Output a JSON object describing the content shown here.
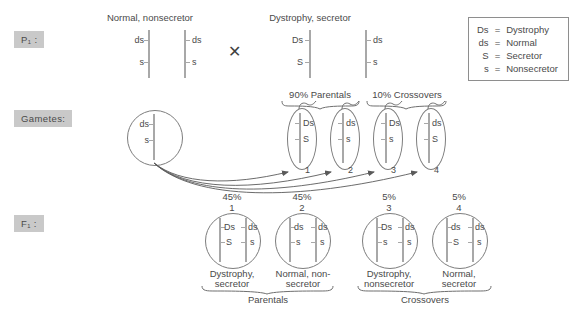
{
  "diagram": {
    "title_rows": {
      "p1": "P₁ :",
      "gametes": "Gametes:",
      "f1": "F₁ :"
    },
    "cross_symbol": "✕",
    "p1": {
      "parent_left": {
        "phenotype": "Normal, nonsecretor",
        "homolog_a": [
          "ds",
          "s"
        ],
        "homolog_b": [
          "ds",
          "s"
        ]
      },
      "parent_right": {
        "phenotype": "Dystrophy, secretor",
        "homolog_a": [
          "Ds",
          "S"
        ],
        "homolog_b": [
          "ds",
          "s"
        ]
      }
    },
    "group_headers": [
      {
        "label": "90% Parentals"
      },
      {
        "label": "10% Crossovers"
      }
    ],
    "gametes": {
      "maternal": {
        "alleles": [
          "ds",
          "s"
        ]
      },
      "paternal": [
        {
          "number": "1",
          "alleles": [
            "Ds",
            "S"
          ]
        },
        {
          "number": "2",
          "alleles": [
            "ds",
            "s"
          ]
        },
        {
          "number": "3",
          "alleles": [
            "Ds",
            "s"
          ]
        },
        {
          "number": "4",
          "alleles": [
            "ds",
            "S"
          ]
        }
      ]
    },
    "f1": {
      "offspring": [
        {
          "percent": "45%",
          "number": "1",
          "chromosome_left": [
            "Ds",
            "S"
          ],
          "chromosome_right": [
            "ds",
            "s"
          ],
          "phenotype_line1": "Dystrophy,",
          "phenotype_line2": "secretor"
        },
        {
          "percent": "45%",
          "number": "2",
          "chromosome_left": [
            "ds",
            "s"
          ],
          "chromosome_right": [
            "ds",
            "s"
          ],
          "phenotype_line1": "Normal, non-",
          "phenotype_line2": "secretor"
        },
        {
          "percent": "5%",
          "number": "3",
          "chromosome_left": [
            "Ds",
            "s"
          ],
          "chromosome_right": [
            "ds",
            "s"
          ],
          "phenotype_line1": "Dystrophy,",
          "phenotype_line2": "nonsecretor"
        },
        {
          "percent": "5%",
          "number": "4",
          "chromosome_left": [
            "ds",
            "S"
          ],
          "chromosome_right": [
            "ds",
            "s"
          ],
          "phenotype_line1": "Normal,",
          "phenotype_line2": "secretor"
        }
      ],
      "group_labels": [
        {
          "label": "Parentals"
        },
        {
          "label": "Crossovers"
        }
      ]
    },
    "legend": {
      "rows": [
        {
          "symbol": "Ds",
          "equals": "=",
          "meaning": "Dystrophy"
        },
        {
          "symbol": "ds",
          "equals": "=",
          "meaning": "Normal"
        },
        {
          "symbol": "S",
          "equals": "=",
          "meaning": "Secretor"
        },
        {
          "symbol": "s",
          "equals": "=",
          "meaning": "Nonsecretor"
        }
      ]
    },
    "colors": {
      "ink": "#4a4a4a",
      "line": "#7d7d7d",
      "bar": "#a8a8a8",
      "tag_bg": "#c9c9c9"
    }
  }
}
